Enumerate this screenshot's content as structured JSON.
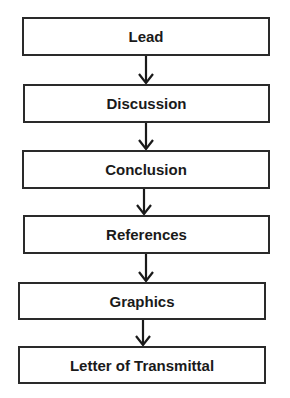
{
  "flowchart": {
    "steps": [
      {
        "label": "Lead"
      },
      {
        "label": "Discussion"
      },
      {
        "label": "Conclusion"
      },
      {
        "label": "References"
      },
      {
        "label": "Graphics"
      },
      {
        "label": "Letter of Transmittal"
      }
    ],
    "colors": {
      "stroke": "#2a2a2a",
      "text": "#1a1a1a",
      "background": "#ffffff"
    }
  }
}
